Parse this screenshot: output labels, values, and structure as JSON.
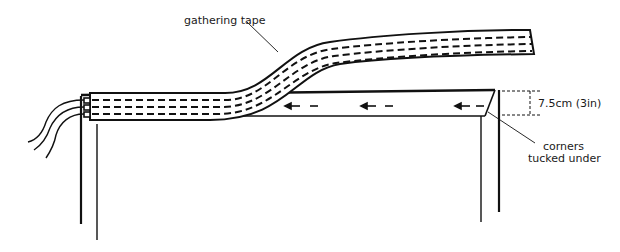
{
  "diagram": {
    "labels": {
      "gathering_tape": "gathering tape",
      "measurement": "7.5cm (3in)",
      "corners_line1": "corners",
      "corners_line2": "tucked under"
    },
    "colors": {
      "ink": "#111111",
      "background": "#ffffff"
    }
  }
}
